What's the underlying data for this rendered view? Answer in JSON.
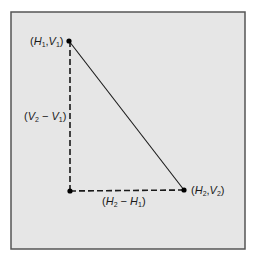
{
  "diagram": {
    "frame": {
      "x": 11,
      "y": 12,
      "width": 234,
      "height": 237,
      "fill": "#e6e6e6",
      "stroke": "#555555"
    },
    "points": {
      "p1": {
        "x": 69,
        "y": 41,
        "label_prefix": "(",
        "h": "H",
        "h_sub": "1",
        "v": "V",
        "v_sub": "1",
        "label_suffix": ")"
      },
      "corner": {
        "x": 70,
        "y": 191
      },
      "p2": {
        "x": 184,
        "y": 190,
        "h": "H",
        "h_sub": "2",
        "v": "V",
        "v_sub": "2"
      }
    },
    "labels": {
      "vertical_diff": {
        "v2": "V",
        "v2_sub": "2",
        "minus": " − ",
        "v1": "V",
        "v1_sub": "1"
      },
      "horizontal_diff": {
        "h2": "H",
        "h2_sub": "2",
        "minus": " − ",
        "h1": "H",
        "h1_sub": "1"
      }
    },
    "colors": {
      "line": "#1a1a1a",
      "point": "#000000"
    }
  }
}
